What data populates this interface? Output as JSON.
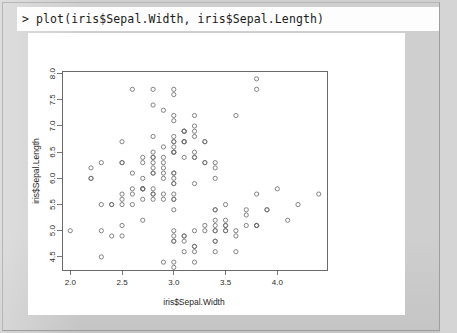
{
  "console": {
    "prompt": ">",
    "command": "plot(iris$Sepal.Width, iris$Sepal.Length)",
    "line": "> plot(iris$Sepal.Width, iris$Sepal.Length)"
  },
  "window": {
    "frame_color": "#cfcfcf",
    "panel_color": "#ffffff"
  },
  "chart_data": {
    "type": "scatter",
    "title": "",
    "xlabel": "iris$Sepal.Width",
    "ylabel": "iris$Sepal.Length",
    "xlim": [
      1.92,
      4.48
    ],
    "ylim": [
      4.25,
      8.05
    ],
    "xticks": [
      2.0,
      2.5,
      3.0,
      3.5,
      4.0
    ],
    "xtick_labels": [
      "2.0",
      "2.5",
      "3.0",
      "3.5",
      "4.0"
    ],
    "yticks": [
      4.5,
      5.0,
      5.5,
      6.0,
      6.5,
      7.0,
      7.5,
      8.0
    ],
    "ytick_labels": [
      "4.5",
      "5.0",
      "5.5",
      "6.0",
      "6.5",
      "7.0",
      "7.5",
      "8.0"
    ],
    "grid": false,
    "legend": false,
    "marker": "open-circle",
    "marker_color": "#6e6e6e",
    "n_points": 150,
    "x": [
      3.5,
      3.0,
      3.2,
      3.1,
      3.6,
      3.9,
      3.4,
      3.4,
      2.9,
      3.1,
      3.7,
      3.4,
      3.0,
      3.0,
      4.0,
      4.4,
      3.9,
      3.5,
      3.8,
      3.8,
      3.4,
      3.7,
      3.6,
      3.3,
      3.4,
      3.0,
      3.4,
      3.5,
      3.4,
      3.2,
      3.1,
      3.4,
      4.1,
      4.2,
      3.1,
      3.2,
      3.5,
      3.6,
      3.0,
      3.4,
      3.5,
      2.3,
      3.2,
      3.5,
      3.8,
      3.0,
      3.8,
      3.2,
      3.7,
      3.3,
      3.2,
      3.2,
      3.1,
      2.3,
      2.8,
      2.8,
      3.3,
      2.4,
      2.9,
      2.7,
      2.0,
      3.0,
      2.2,
      2.9,
      2.9,
      3.1,
      3.0,
      2.7,
      2.2,
      2.5,
      3.2,
      2.8,
      2.5,
      2.8,
      2.9,
      3.0,
      2.8,
      3.0,
      2.9,
      2.6,
      2.4,
      2.4,
      2.7,
      2.7,
      3.0,
      3.4,
      3.1,
      2.3,
      3.0,
      2.5,
      2.6,
      3.0,
      2.6,
      2.3,
      2.7,
      3.0,
      2.9,
      2.9,
      2.5,
      2.8,
      3.3,
      2.7,
      3.0,
      2.9,
      3.0,
      3.0,
      2.5,
      2.9,
      2.5,
      3.6,
      3.2,
      2.7,
      3.0,
      2.5,
      2.8,
      3.2,
      3.0,
      3.8,
      2.6,
      2.2,
      3.2,
      2.8,
      2.8,
      2.7,
      3.3,
      3.2,
      2.8,
      3.0,
      2.8,
      3.0,
      2.8,
      3.8,
      2.8,
      2.8,
      2.6,
      3.0,
      3.4,
      3.1,
      3.0,
      3.1,
      3.1,
      3.1,
      2.7,
      3.2,
      3.3,
      3.0,
      2.5,
      3.0,
      3.4,
      3.0
    ],
    "y": [
      5.1,
      4.9,
      4.7,
      4.6,
      5.0,
      5.4,
      4.6,
      5.0,
      4.4,
      4.9,
      5.4,
      4.8,
      4.8,
      4.3,
      5.8,
      5.7,
      5.4,
      5.1,
      5.7,
      5.1,
      5.4,
      5.1,
      4.6,
      5.1,
      4.8,
      5.0,
      5.0,
      5.2,
      5.2,
      4.7,
      4.8,
      5.4,
      5.2,
      5.5,
      4.9,
      5.0,
      5.5,
      4.9,
      4.4,
      5.1,
      5.0,
      4.5,
      4.4,
      5.0,
      5.1,
      4.8,
      5.1,
      4.6,
      5.3,
      5.0,
      7.0,
      6.4,
      6.9,
      5.5,
      6.5,
      5.7,
      6.3,
      4.9,
      6.6,
      5.2,
      5.0,
      5.9,
      6.0,
      6.1,
      5.6,
      6.7,
      5.6,
      5.8,
      6.2,
      5.6,
      5.9,
      6.1,
      6.3,
      6.1,
      6.4,
      6.6,
      6.8,
      6.7,
      6.0,
      5.7,
      5.5,
      5.5,
      5.8,
      6.0,
      5.4,
      6.0,
      6.7,
      6.3,
      5.6,
      5.5,
      5.5,
      6.1,
      5.8,
      5.0,
      5.6,
      5.7,
      5.7,
      6.2,
      5.1,
      5.7,
      6.3,
      5.8,
      7.1,
      6.3,
      6.5,
      7.6,
      4.9,
      7.3,
      6.7,
      7.2,
      6.5,
      6.4,
      6.8,
      5.7,
      5.8,
      6.4,
      6.5,
      7.7,
      7.7,
      6.0,
      6.9,
      5.6,
      7.7,
      6.3,
      6.7,
      7.2,
      6.2,
      6.1,
      6.4,
      7.2,
      7.4,
      7.9,
      6.4,
      6.3,
      6.1,
      7.7,
      6.3,
      6.4,
      6.0,
      6.9,
      6.7,
      6.9,
      5.8,
      6.8,
      6.7,
      6.7,
      6.3,
      6.5,
      6.2,
      5.9
    ]
  }
}
